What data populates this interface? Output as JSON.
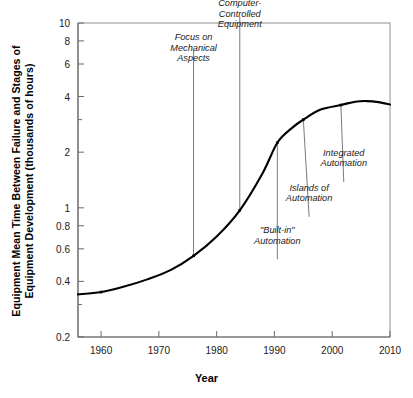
{
  "chart_data": {
    "type": "line",
    "title": "",
    "xlabel": "Year",
    "ylabel_lines": [
      "Equipment Mean Time Between Failure and Stages of",
      "Equipment Development (thousands of hours)"
    ],
    "ylabel": "Equipment Mean Time Between Failure and Stages of Equipment Development (thousands of hours)",
    "yscale": "log",
    "ylim": [
      0.2,
      10
    ],
    "xlim": [
      1956,
      2010
    ],
    "grid": false,
    "legend": null,
    "x_ticks": [
      1960,
      1970,
      1980,
      1990,
      2000,
      2010
    ],
    "x_tick_labels": [
      "1960",
      "1970",
      "1980",
      "1990",
      "2000",
      "2010"
    ],
    "y_ticks": [
      0.2,
      0.3,
      0.4,
      0.6,
      0.8,
      1,
      2,
      3,
      4,
      6,
      8,
      10
    ],
    "y_tick_labels": [
      "0.2",
      "",
      "0.4",
      "0.6",
      "0.8",
      "1",
      "2",
      "",
      "4",
      "6",
      "8",
      "10"
    ],
    "line_color": "#000000",
    "series": [
      {
        "name": "Equipment MTBF",
        "x": [
          1956,
          1960,
          1964,
          1968,
          1972,
          1976,
          1980,
          1984,
          1988,
          1990.5,
          1993,
          1995,
          1998,
          2001.5,
          2004,
          2006,
          2008,
          2010
        ],
        "y": [
          0.34,
          0.35,
          0.375,
          0.41,
          0.46,
          0.55,
          0.7,
          0.97,
          1.55,
          2.25,
          2.7,
          3.0,
          3.4,
          3.6,
          3.75,
          3.78,
          3.73,
          3.62
        ]
      }
    ],
    "markers": [
      {
        "x": 1960,
        "y": 0.35
      },
      {
        "x": 1976,
        "y": 0.55
      },
      {
        "x": 1984,
        "y": 0.97
      },
      {
        "x": 1990.5,
        "y": 2.25
      },
      {
        "x": 1995,
        "y": 3.0
      },
      {
        "x": 2001.5,
        "y": 3.6
      }
    ],
    "annotations": [
      {
        "name": "focus-on-mechanical-aspects",
        "lines": [
          "Focus on",
          "Mechanical",
          "Aspects"
        ],
        "text": "Focus on Mechanical Aspects",
        "anchor_x": 1976,
        "anchor_y": 0.55,
        "label_x": 1976,
        "label_top_y": 6.0
      },
      {
        "name": "computer-controlled-equipment",
        "lines": [
          "Computer-",
          "Controlled",
          "Equipment"
        ],
        "text": "Computer-Controlled Equipment",
        "anchor_x": 1984,
        "anchor_y": 0.97,
        "label_x": 1984,
        "label_top_y": 9.2
      },
      {
        "name": "built-in-automation",
        "lines": [
          "\"Built-in\"",
          "Automation"
        ],
        "text": "\"Built-in\" Automation",
        "anchor_x": 1990.5,
        "anchor_y": 2.25,
        "label_x": 1990.5,
        "label_top_y": 0.62
      },
      {
        "name": "islands-of-automation",
        "lines": [
          "Islands of",
          "Automation"
        ],
        "text": "Islands of Automation",
        "anchor_x": 1995,
        "anchor_y": 3.0,
        "label_x": 1996,
        "label_top_y": 1.05
      },
      {
        "name": "integrated-automation",
        "lines": [
          "Integrated",
          "Automation"
        ],
        "text": "Integrated Automation",
        "anchor_x": 2001.5,
        "anchor_y": 3.6,
        "label_x": 2002,
        "label_top_y": 1.62
      }
    ]
  }
}
